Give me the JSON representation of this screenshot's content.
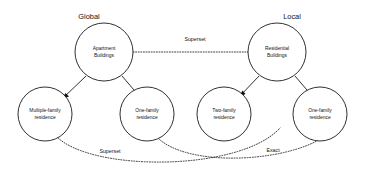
{
  "diagram": {
    "title_left": "Global",
    "title_right": "Local",
    "groups": [
      {
        "id": "global",
        "label": "Global",
        "x": 89,
        "y": 17
      },
      {
        "id": "local",
        "label": "Local",
        "x": 292,
        "y": 17
      }
    ],
    "nodes": [
      {
        "id": "apartment-buildings",
        "line1": "Apartment",
        "line2": "Buildings",
        "cx": 104,
        "cy": 52,
        "r": 29
      },
      {
        "id": "residential-buildings",
        "line1": "Residential",
        "line2": "Buildings",
        "cx": 277,
        "cy": 52,
        "r": 29
      },
      {
        "id": "multiple-family-residence",
        "line1": "Multiple-family",
        "line2": "residence",
        "cx": 45,
        "cy": 114,
        "r": 27
      },
      {
        "id": "one-family-residence-global",
        "line1": "One-family",
        "line2": "residence",
        "cx": 147,
        "cy": 114,
        "r": 27
      },
      {
        "id": "two-family-residence",
        "line1": "Two-family",
        "line2": "residence",
        "cx": 224,
        "cy": 114,
        "r": 27
      },
      {
        "id": "one-family-residence-local",
        "line1": "One-family",
        "line2": "residence",
        "cx": 320,
        "cy": 114,
        "r": 27
      }
    ],
    "edges": [
      {
        "id": "apartment-to-multiple-family",
        "kind": "solid-arrow",
        "from": "apartment-buildings",
        "to": "multiple-family-residence",
        "label": ""
      },
      {
        "id": "apartment-to-one-family",
        "kind": "solid-arrow",
        "from": "apartment-buildings",
        "to": "one-family-residence-global",
        "label": ""
      },
      {
        "id": "residential-to-two-family",
        "kind": "solid-arrow",
        "from": "residential-buildings",
        "to": "two-family-residence",
        "label": ""
      },
      {
        "id": "residential-to-one-family",
        "kind": "solid-arrow",
        "from": "residential-buildings",
        "to": "one-family-residence-local",
        "label": ""
      },
      {
        "id": "apartment-to-residential-superset",
        "kind": "dotted",
        "from": "apartment-buildings",
        "to": "residential-buildings",
        "label": "Superset",
        "label_x": 195,
        "label_y": 40
      },
      {
        "id": "multiple-family-to-two-family-superset",
        "kind": "dotted",
        "from": "multiple-family-residence",
        "to": "two-family-residence",
        "label": "Superset",
        "label_x": 110,
        "label_y": 152
      },
      {
        "id": "one-family-to-one-family-exact",
        "kind": "dotted",
        "from": "one-family-residence-global",
        "to": "one-family-residence-local",
        "label": "Exact",
        "label_x": 273,
        "label_y": 151
      }
    ]
  }
}
